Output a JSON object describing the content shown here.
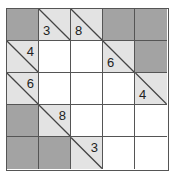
{
  "puzzle": {
    "type": "kakuro",
    "rows": 5,
    "cols": 5,
    "colors": {
      "dark_cell": "#a3a3a3",
      "clue_cell": "#e3e3e3",
      "white_cell": "#ffffff",
      "grid_line": "#555555"
    },
    "cells": [
      [
        {
          "type": "dark"
        },
        {
          "type": "clue",
          "down": "3"
        },
        {
          "type": "clue",
          "down": "8"
        },
        {
          "type": "dark"
        },
        {
          "type": "dark"
        }
      ],
      [
        {
          "type": "clue",
          "across": "4"
        },
        {
          "type": "white"
        },
        {
          "type": "white"
        },
        {
          "type": "clue",
          "down": "6"
        },
        {
          "type": "dark"
        }
      ],
      [
        {
          "type": "clue",
          "across": "6"
        },
        {
          "type": "white"
        },
        {
          "type": "white"
        },
        {
          "type": "white"
        },
        {
          "type": "clue",
          "down": "4"
        }
      ],
      [
        {
          "type": "dark"
        },
        {
          "type": "clue",
          "across": "8"
        },
        {
          "type": "white"
        },
        {
          "type": "white"
        },
        {
          "type": "white"
        }
      ],
      [
        {
          "type": "dark"
        },
        {
          "type": "dark"
        },
        {
          "type": "clue",
          "across": "3"
        },
        {
          "type": "white"
        },
        {
          "type": "white"
        }
      ]
    ]
  }
}
